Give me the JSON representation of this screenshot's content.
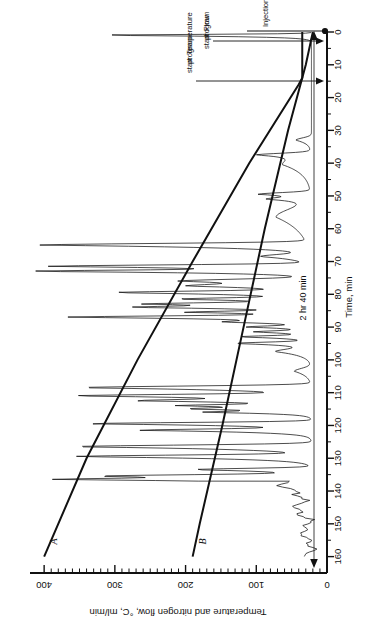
{
  "figure": {
    "type": "chromatogram",
    "orientation": "rotated-90-ccw",
    "background": "#ffffff",
    "ink_color": "#111111"
  },
  "annotations": {
    "injection": "Injection",
    "flow_program_start": "Flow\nprogram\nstart",
    "flow_program_start_lines": [
      "Flow",
      "program",
      "start"
    ],
    "temperature_program_start_lines": [
      "Temperature",
      "program",
      "start"
    ],
    "run_duration": "2 hr 40 min"
  },
  "curve_labels": {
    "a": "A",
    "b": "B"
  },
  "chart_data": {
    "type": "line",
    "title": "",
    "subtitle": "",
    "xlabel": "Time, min",
    "ylabel": "Temperature and nitrogen flow, °C, ml/min",
    "xlim": [
      0,
      165
    ],
    "ylim": [
      0,
      420
    ],
    "grid": false,
    "legend_position": "inline-curve-labels",
    "x_ticks_major": [
      0,
      10,
      20,
      30,
      40,
      50,
      60,
      70,
      80,
      90,
      100,
      110,
      120,
      130,
      140,
      150,
      160
    ],
    "x_tick_labels": [
      "0",
      "10",
      "20",
      "30",
      "40",
      "50",
      "60",
      "70",
      "80",
      "90",
      "100",
      "110",
      "120",
      "130",
      "140",
      "150",
      "160"
    ],
    "x_minor_step": 5,
    "y_ticks_major": [
      0,
      100,
      200,
      300,
      400
    ],
    "y_tick_labels": [
      "0",
      "100",
      "200",
      "300",
      "400"
    ],
    "y_minor_step": 10,
    "series": [
      {
        "name": "A",
        "label": "A",
        "description": "Temperature program ramp, °C",
        "x": [
          0,
          14,
          16,
          40,
          70,
          100,
          130,
          160
        ],
        "values": [
          35,
          35,
          40,
          110,
          190,
          268,
          340,
          400
        ]
      },
      {
        "name": "B",
        "label": "B",
        "description": "Nitrogen flow program, ml/min",
        "x": [
          0,
          2,
          10,
          30,
          60,
          90,
          120,
          150,
          160
        ],
        "values": [
          20,
          22,
          30,
          55,
          88,
          118,
          148,
          180,
          190
        ]
      },
      {
        "name": "detector",
        "label": "",
        "description": "Detector chromatogram trace (baseline near 20 ml/min equivalent, many peaks)",
        "baseline_value": 22,
        "peaks": [
          {
            "t": 1.0,
            "height": 330,
            "width": 0.5
          },
          {
            "t": 33.0,
            "height": 44,
            "width": 1.4
          },
          {
            "t": 37.5,
            "height": 92,
            "width": 1.0
          },
          {
            "t": 40.5,
            "height": 62,
            "width": 3.6
          },
          {
            "t": 49.5,
            "height": 95,
            "width": 1.0
          },
          {
            "t": 51.0,
            "height": 70,
            "width": 0.9
          },
          {
            "t": 56.5,
            "height": 72,
            "width": 5.4
          },
          {
            "t": 65.0,
            "height": 400,
            "width": 1.0
          },
          {
            "t": 68.5,
            "height": 90,
            "width": 1.3
          },
          {
            "t": 71.5,
            "height": 392,
            "width": 0.9
          },
          {
            "t": 73.0,
            "height": 385,
            "width": 0.7
          },
          {
            "t": 76.0,
            "height": 210,
            "width": 1.2
          },
          {
            "t": 77.5,
            "height": 160,
            "width": 1.0
          },
          {
            "t": 79.5,
            "height": 290,
            "width": 0.9
          },
          {
            "t": 81.5,
            "height": 200,
            "width": 0.8
          },
          {
            "t": 83.0,
            "height": 245,
            "width": 0.8
          },
          {
            "t": 84.0,
            "height": 230,
            "width": 0.7
          },
          {
            "t": 85.5,
            "height": 188,
            "width": 0.7
          },
          {
            "t": 87.0,
            "height": 360,
            "width": 0.8
          },
          {
            "t": 88.5,
            "height": 120,
            "width": 0.7
          },
          {
            "t": 90.0,
            "height": 108,
            "width": 0.7
          },
          {
            "t": 91.5,
            "height": 100,
            "width": 0.7
          },
          {
            "t": 93.0,
            "height": 122,
            "width": 0.7
          },
          {
            "t": 95.0,
            "height": 130,
            "width": 0.8
          },
          {
            "t": 97.5,
            "height": 72,
            "width": 1.6
          },
          {
            "t": 103.5,
            "height": 46,
            "width": 1.8
          },
          {
            "t": 108.5,
            "height": 350,
            "width": 1.0
          },
          {
            "t": 111.0,
            "height": 352,
            "width": 0.9
          },
          {
            "t": 112.5,
            "height": 230,
            "width": 0.8
          },
          {
            "t": 114.0,
            "height": 195,
            "width": 0.7
          },
          {
            "t": 115.0,
            "height": 168,
            "width": 0.7
          },
          {
            "t": 116.0,
            "height": 150,
            "width": 0.6
          },
          {
            "t": 119.5,
            "height": 340,
            "width": 0.8
          },
          {
            "t": 121.5,
            "height": 255,
            "width": 0.8
          },
          {
            "t": 126.5,
            "height": 360,
            "width": 1.0
          },
          {
            "t": 129.5,
            "height": 355,
            "width": 0.9
          },
          {
            "t": 133.5,
            "height": 190,
            "width": 0.8
          },
          {
            "t": 135.5,
            "height": 320,
            "width": 0.9
          },
          {
            "t": 136.5,
            "height": 312,
            "width": 0.7
          }
        ],
        "tail_noise": {
          "from_t": 137,
          "to_t": 160,
          "amplitude": 18,
          "description": "noisy drifting baseline after last peak"
        }
      }
    ],
    "event_markers": [
      {
        "label": "Injection",
        "t": 0.5
      },
      {
        "label": "Flow program start",
        "t": 1.5
      },
      {
        "label": "Temperature program start",
        "t": 15.0
      }
    ],
    "span_annotation": {
      "label": "2 hr 40 min",
      "from_t": 0,
      "to_t": 160
    }
  }
}
